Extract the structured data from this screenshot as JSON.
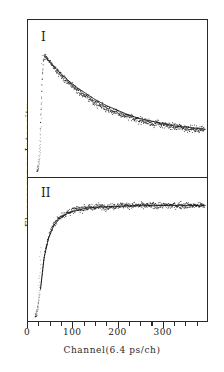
{
  "figure": {
    "panel_1_label": "I",
    "panel_2_label": "II",
    "x_axis_title": "Channel(6.4 ps/ch)",
    "y_axis_title": "Fluorescence Intensity"
  },
  "axis": {
    "tick_labels": [
      "0",
      "100",
      "200",
      "300"
    ],
    "tick_values": [
      0,
      100,
      200,
      300
    ],
    "minor_tick_values": [
      25,
      50,
      75,
      125,
      150,
      175,
      225,
      250,
      275,
      325,
      350,
      375
    ]
  },
  "colors": {
    "frame": "#2a2a2a",
    "data_points": "#1a1a1a",
    "fit_curve": "#111111",
    "background": "#ffffff"
  },
  "chart_data": {
    "type": "scatter",
    "title": "",
    "xlabel": "Channel(6.4 ps/ch)",
    "ylabel": "Fluorescence Intensity",
    "xlim": [
      0,
      400
    ],
    "xticks": [
      0,
      100,
      200,
      300
    ],
    "grid": false,
    "legend": "none",
    "panels": [
      {
        "label": "I",
        "description": "Fast rise near channel 25-40 followed by slow exponential fluorescence decay",
        "ylim": [
          0,
          1.05
        ],
        "yticks": [],
        "series": [
          {
            "name": "data",
            "style": "scatter",
            "x": [
              20,
              22,
              24,
              26,
              28,
              30,
              32,
              34,
              36,
              38,
              40,
              44,
              48,
              52,
              56,
              60,
              66,
              72,
              78,
              84,
              90,
              96,
              104,
              112,
              120,
              128,
              136,
              144,
              152,
              160,
              170,
              180,
              190,
              200,
              210,
              220,
              230,
              240,
              250,
              260,
              270,
              280,
              290,
              300,
              310,
              320,
              330,
              340,
              350,
              360,
              370,
              380,
              390
            ],
            "y": [
              0.02,
              0.05,
              0.11,
              0.22,
              0.4,
              0.62,
              0.8,
              0.9,
              0.95,
              0.97,
              0.96,
              0.94,
              0.92,
              0.9,
              0.88,
              0.86,
              0.84,
              0.81,
              0.79,
              0.77,
              0.75,
              0.73,
              0.7,
              0.68,
              0.65,
              0.63,
              0.61,
              0.59,
              0.57,
              0.56,
              0.54,
              0.52,
              0.5,
              0.49,
              0.47,
              0.46,
              0.45,
              0.44,
              0.43,
              0.42,
              0.41,
              0.4,
              0.4,
              0.39,
              0.38,
              0.38,
              0.37,
              0.37,
              0.36,
              0.36,
              0.35,
              0.35,
              0.35
            ]
          },
          {
            "name": "fit",
            "style": "line",
            "x": [
              36,
              50,
              70,
              90,
              110,
              130,
              150,
              175,
              200,
              225,
              250,
              275,
              300,
              325,
              350,
              375,
              395
            ],
            "y": [
              0.97,
              0.91,
              0.83,
              0.76,
              0.7,
              0.65,
              0.6,
              0.55,
              0.51,
              0.47,
              0.44,
              0.42,
              0.4,
              0.38,
              0.37,
              0.36,
              0.35
            ]
          }
        ]
      },
      {
        "label": "II",
        "description": "Fast rise near channel 20-30 then exponential rise to a flat plateau",
        "ylim": [
          0,
          1.05
        ],
        "yticks": [],
        "series": [
          {
            "name": "data",
            "style": "scatter",
            "x": [
              16,
              18,
              20,
              22,
              24,
              26,
              28,
              30,
              32,
              34,
              36,
              38,
              40,
              44,
              48,
              52,
              56,
              60,
              66,
              72,
              78,
              84,
              90,
              96,
              104,
              112,
              120,
              128,
              136,
              144,
              152,
              160,
              170,
              180,
              190,
              200,
              210,
              220,
              230,
              240,
              250,
              260,
              270,
              280,
              290,
              300,
              310,
              320,
              330,
              340,
              350,
              360,
              370,
              380,
              390
            ],
            "y": [
              0.02,
              0.04,
              0.06,
              0.09,
              0.13,
              0.18,
              0.24,
              0.31,
              0.38,
              0.45,
              0.51,
              0.56,
              0.6,
              0.66,
              0.71,
              0.75,
              0.78,
              0.81,
              0.84,
              0.86,
              0.88,
              0.89,
              0.9,
              0.91,
              0.92,
              0.93,
              0.93,
              0.94,
              0.94,
              0.94,
              0.95,
              0.95,
              0.95,
              0.95,
              0.95,
              0.96,
              0.96,
              0.96,
              0.96,
              0.96,
              0.96,
              0.96,
              0.96,
              0.96,
              0.96,
              0.96,
              0.96,
              0.96,
              0.96,
              0.96,
              0.96,
              0.96,
              0.96,
              0.96,
              0.96
            ]
          },
          {
            "name": "fit",
            "style": "line",
            "x": [
              28,
              36,
              46,
              58,
              72,
              88,
              104,
              122,
              140,
              160,
              185,
              210,
              240,
              270,
              300,
              330,
              360,
              395
            ],
            "y": [
              0.24,
              0.51,
              0.68,
              0.79,
              0.85,
              0.89,
              0.91,
              0.93,
              0.94,
              0.945,
              0.95,
              0.955,
              0.957,
              0.958,
              0.959,
              0.96,
              0.96,
              0.96
            ]
          }
        ]
      }
    ]
  }
}
